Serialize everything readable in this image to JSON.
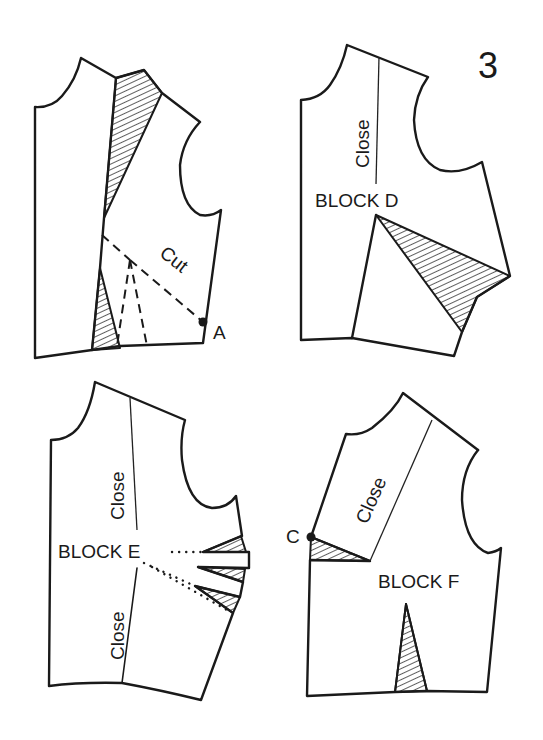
{
  "figure": {
    "number": "3",
    "colors": {
      "ink": "#1a1a1a",
      "paper": "#ffffff"
    }
  },
  "panels": [
    {
      "id": "top-left",
      "title": "",
      "labels": {
        "cut": "Cut",
        "point": "A"
      }
    },
    {
      "id": "top-right",
      "title": "BLOCK D",
      "labels": {
        "close": "Close"
      }
    },
    {
      "id": "bottom-left",
      "title": "BLOCK E",
      "labels": {
        "close_upper": "Close",
        "close_lower": "Close"
      }
    },
    {
      "id": "bottom-right",
      "title": "BLOCK F",
      "labels": {
        "close": "Close",
        "point": "C"
      }
    }
  ]
}
